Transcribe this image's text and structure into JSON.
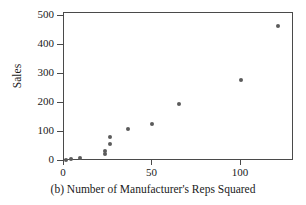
{
  "chart_data": {
    "type": "scatter",
    "title": "",
    "caption": "(b) Number of Manufacturer's Reps Squared",
    "xlabel": "",
    "ylabel": "Sales",
    "xlim": [
      0,
      130
    ],
    "ylim": [
      0,
      510
    ],
    "xticks": [
      0,
      50,
      100
    ],
    "yticks": [
      0,
      100,
      200,
      300,
      400,
      500
    ],
    "xtick_labels": [
      "0",
      "50",
      "100"
    ],
    "ytick_labels": [
      "0",
      "100",
      "200",
      "300",
      "400",
      "500"
    ],
    "grid": false,
    "legend": null,
    "marker_color": "#5b5b5b",
    "axis_color": "#4a4a4a",
    "points": [
      {
        "x": 1,
        "y": 4
      },
      {
        "x": 4,
        "y": 8
      },
      {
        "x": 9,
        "y": 10
      },
      {
        "x": 23,
        "y": 25
      },
      {
        "x": 23,
        "y": 33
      },
      {
        "x": 26,
        "y": 57
      },
      {
        "x": 26,
        "y": 83
      },
      {
        "x": 36,
        "y": 110
      },
      {
        "x": 50,
        "y": 128
      },
      {
        "x": 65,
        "y": 198
      },
      {
        "x": 100,
        "y": 280
      },
      {
        "x": 121,
        "y": 465
      }
    ]
  }
}
